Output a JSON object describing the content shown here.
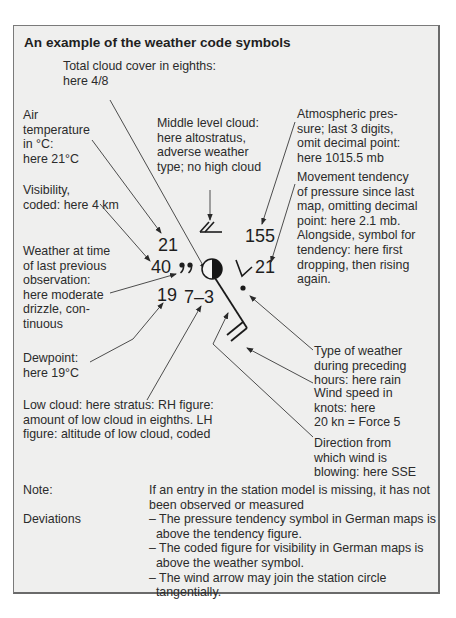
{
  "title": "An example of the weather code symbols",
  "labels": {
    "total_cloud": [
      "Total cloud cover in eighths:",
      "here 4/8"
    ],
    "air_temp": [
      "Air",
      "temperature",
      "in °C:",
      "here 21°C"
    ],
    "middle_cloud": [
      "Middle level cloud:",
      "here altostratus,",
      "adverse weather",
      "type; no high cloud"
    ],
    "pressure": [
      "Atmospheric pres-",
      "sure; last 3 digits,",
      "omit decimal point:",
      "here 1015.5 mb"
    ],
    "visibility": [
      "Visibility,",
      "coded: here 4 km"
    ],
    "tendency": [
      "Movement tendency",
      "of pressure since last",
      "map, omitting decimal",
      "point: here 2.1 mb.",
      "Alongside, symbol for",
      "tendency: here first",
      "dropping, then rising",
      "again."
    ],
    "weather_prev": [
      "Weather at time",
      "of last previous",
      "observation:",
      "here moderate",
      "drizzle, con-",
      "tinuous"
    ],
    "dewpoint": [
      "Dewpoint:",
      "here 19°C"
    ],
    "past_weather": [
      "Type of weather",
      "during preceding",
      "hours: here rain"
    ],
    "low_cloud": [
      "Low cloud: here stratus: RH figure:",
      "amount of low cloud in eighths. LH",
      "figure: altitude of low cloud, coded"
    ],
    "wind_speed": [
      "Wind speed in",
      "knots: here",
      "20 kn = Force 5"
    ],
    "wind_dir": [
      "Direction from",
      "which wind is",
      "blowing: here SSE"
    ]
  },
  "station": {
    "temperature": "21",
    "visibility": "40",
    "dewpoint": "19",
    "low_cloud": "7–3",
    "pressure": "155",
    "tendency": "21",
    "cloud_cover_eighths": 4
  },
  "notes": {
    "note_label": "Note:",
    "note_lines": [
      "If an entry in the station model is missing, it has not",
      "been observed or measured"
    ],
    "deviations_label": "Deviations",
    "deviation_lines": [
      "– The pressure tendency symbol in German maps is",
      "  above the tendency figure.",
      "– The coded figure for visibility in German maps is",
      "  above the weather symbol.",
      "– The wind arrow may join the station circle",
      "  tangentially."
    ]
  }
}
